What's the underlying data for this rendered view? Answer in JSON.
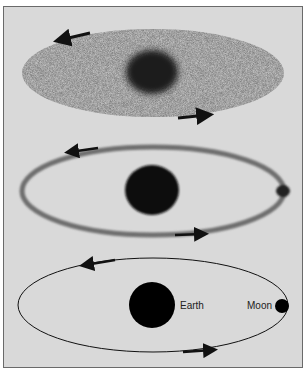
{
  "panels": [
    {
      "id": "panel-1",
      "description": "Diffuse elliptical cloud with dark central mass and rotation arrows"
    },
    {
      "id": "panel-2",
      "description": "Elliptical ring with dense central mass and small body at right end"
    },
    {
      "id": "panel-3",
      "description": "Orbit ellipse with Earth at center and Moon at right"
    }
  ],
  "labels": {
    "earth": "Earth",
    "moon": "Moon"
  },
  "colors": {
    "background": "#d9d9d9",
    "ink": "#111111",
    "cloud": "#7a7a7a"
  }
}
